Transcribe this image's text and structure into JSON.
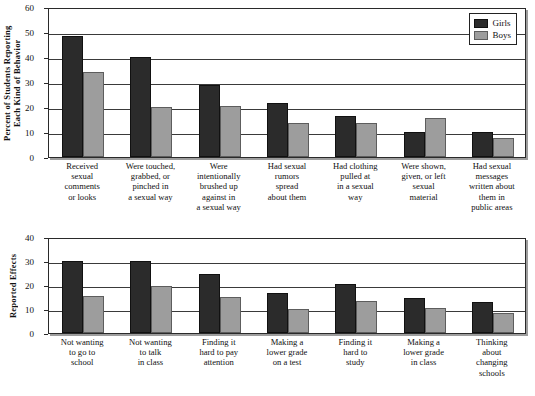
{
  "chart_data": [
    {
      "type": "bar",
      "title": "",
      "xlabel": "",
      "ylabel": "Percent of Students Reporting\nEach Kind of Behavior",
      "ylim": [
        0,
        60
      ],
      "yticks": [
        0,
        10,
        20,
        30,
        40,
        50,
        60
      ],
      "grid": true,
      "legend_position": "top-right",
      "categories": [
        "Received\nsexual\ncomments\nor looks",
        "Were touched,\ngrabbed, or\npinched in\na sexual way",
        "Were\nintentionally\nbrushed up\nagainst in\na sexual way",
        "Had sexual\nrumors\nspread\nabout them",
        "Had clothing\npulled at\nin a sexual\nway",
        "Were shown,\ngiven, or left\nsexual\nmaterial",
        "Had sexual\nmessages\nwritten about\nthem in\npublic areas"
      ],
      "series": [
        {
          "name": "Girls",
          "color": "#2b2b2b",
          "values": [
            48.5,
            40,
            29,
            21.5,
            16.5,
            10,
            10
          ]
        },
        {
          "name": "Boys",
          "color": "#9d9d9d",
          "values": [
            34,
            20,
            20.5,
            13.5,
            13.5,
            15.5,
            7.5
          ]
        }
      ]
    },
    {
      "type": "bar",
      "title": "",
      "xlabel": "",
      "ylabel": "Reported Effects",
      "ylim": [
        0,
        40
      ],
      "yticks": [
        0,
        10,
        20,
        30,
        40
      ],
      "grid": true,
      "legend_position": "none",
      "categories": [
        "Not wanting\nto go to\nschool",
        "Not wanting\nto talk\nin class",
        "Finding it\nhard to pay\nattention",
        "Making a\nlower grade\non a test",
        "Finding it\nhard to\nstudy",
        "Making a\nlower grade\nin class",
        "Thinking\nabout\nchanging\nschools"
      ],
      "series": [
        {
          "name": "Girls",
          "color": "#2b2b2b",
          "values": [
            30,
            30,
            24.5,
            16.5,
            20.5,
            14.5,
            13
          ]
        },
        {
          "name": "Boys",
          "color": "#9d9d9d",
          "values": [
            15.5,
            19.5,
            15,
            10,
            13.5,
            10.5,
            8.5
          ]
        }
      ]
    }
  ],
  "legend": {
    "items": [
      {
        "label": "Girls",
        "swatch": "girls-swatch"
      },
      {
        "label": "Boys",
        "swatch": "boys-swatch"
      }
    ]
  }
}
